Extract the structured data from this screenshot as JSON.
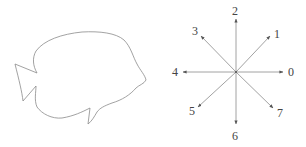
{
  "figure": {
    "left_panel": {
      "name": "fish-outline",
      "stroke_color": "#8a8a8a"
    },
    "right_panel": {
      "name": "chain-code-directions",
      "center": [
        236,
        72
      ],
      "line_color": "#8a8a8a",
      "label_color": "#444444",
      "directions": [
        {
          "code": "0",
          "label": "0",
          "angle_deg": 0
        },
        {
          "code": "1",
          "label": "1",
          "angle_deg": 45
        },
        {
          "code": "2",
          "label": "2",
          "angle_deg": 90
        },
        {
          "code": "3",
          "label": "3",
          "angle_deg": 135
        },
        {
          "code": "4",
          "label": "4",
          "angle_deg": 180
        },
        {
          "code": "5",
          "label": "5",
          "angle_deg": 225
        },
        {
          "code": "6",
          "label": "6",
          "angle_deg": 270
        },
        {
          "code": "7",
          "label": "7",
          "angle_deg": 315
        }
      ]
    }
  }
}
